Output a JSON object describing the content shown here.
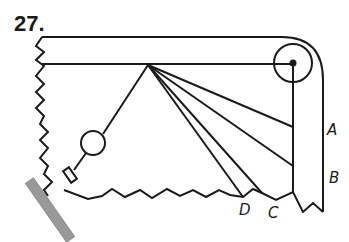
{
  "figure": {
    "number": "27.",
    "labels": {
      "A": "A",
      "B": "B",
      "C": "C",
      "D": "D"
    },
    "colors": {
      "stroke": "#1a1a1a",
      "rod_fill": "#999999",
      "background": "#ffffff"
    }
  }
}
